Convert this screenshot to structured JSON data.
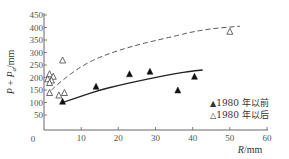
{
  "chart_data": {
    "type": "scatter",
    "title": "",
    "xlabel": "R/mm",
    "xlabel_var": "R",
    "xlabel_unit": "/mm",
    "ylabel": "P + Pa/mm",
    "ylabel_parts": {
      "p1": "P",
      "plus": "+",
      "p2": "P",
      "sub": "a",
      "unit": "/mm"
    },
    "xlim": [
      0,
      60
    ],
    "ylim": [
      0,
      450
    ],
    "x_ticks": [
      0,
      10,
      20,
      30,
      40,
      50,
      60
    ],
    "y_ticks": [
      0,
      50,
      100,
      150,
      200,
      250,
      300,
      350,
      400,
      450
    ],
    "x_tick_labels": [
      "0",
      "10",
      "20",
      "30",
      "40",
      "50",
      "60"
    ],
    "y_tick_labels": [
      "0",
      "50",
      "100",
      "150",
      "200",
      "250",
      "300",
      "350",
      "400",
      "450"
    ],
    "grid": false,
    "legend_position": "bottom-right",
    "series": [
      {
        "name": "1980 年以前",
        "marker": "filled-triangle",
        "color": "#111111",
        "points": [
          [
            5,
            105
          ],
          [
            14,
            165
          ],
          [
            23,
            215
          ],
          [
            28.5,
            225
          ],
          [
            36,
            150
          ],
          [
            40.5,
            205
          ]
        ],
        "fit_curve": {
          "style": "solid",
          "points": [
            [
              5,
              100
            ],
            [
              10,
              125
            ],
            [
              15,
              150
            ],
            [
              20,
              168
            ],
            [
              25,
              185
            ],
            [
              30,
              200
            ],
            [
              35,
              215
            ],
            [
              40,
              226
            ],
            [
              42.7,
              230
            ]
          ]
        }
      },
      {
        "name": "1980 年以后",
        "marker": "open-triangle",
        "color": "#333333",
        "points": [
          [
            1.5,
            215
          ],
          [
            2.5,
            205
          ],
          [
            1,
            195
          ],
          [
            2,
            190
          ],
          [
            1.5,
            180
          ],
          [
            5,
            270
          ],
          [
            1.5,
            140
          ],
          [
            4,
            130
          ],
          [
            5.5,
            140
          ],
          [
            50,
            385
          ]
        ],
        "fit_curve": {
          "style": "dashed",
          "points": [
            [
              2,
              150
            ],
            [
              5,
              190
            ],
            [
              10,
              245
            ],
            [
              15,
              282
            ],
            [
              20,
              308
            ],
            [
              25,
              330
            ],
            [
              30,
              348
            ],
            [
              35,
              365
            ],
            [
              40,
              383
            ],
            [
              45,
              395
            ],
            [
              50,
              402
            ],
            [
              52.7,
              405
            ]
          ]
        }
      }
    ]
  },
  "legend": {
    "items": [
      {
        "symbol": "▲",
        "label": "1980 年以前"
      },
      {
        "symbol": "△",
        "label": "1980 年以后"
      }
    ]
  }
}
